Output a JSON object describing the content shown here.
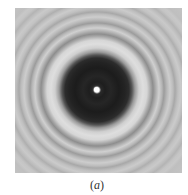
{
  "figure": {
    "caption": {
      "open": "(",
      "label": "a",
      "close": ")"
    }
  }
}
